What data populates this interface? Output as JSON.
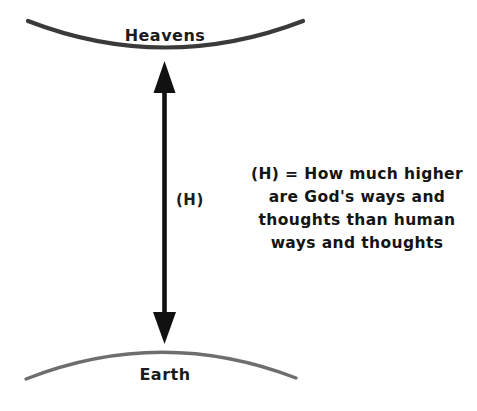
{
  "diagram": {
    "title_alt": "Heavens and Earth comparison diagram",
    "background_color": "#ffffff",
    "heavens": {
      "label": "Heavens",
      "arc_color": "#3a3a3a",
      "arc_thickness": 4
    },
    "earth": {
      "label": "Earth",
      "arc_color": "#6e6e6e",
      "arc_thickness": 3
    },
    "arrow": {
      "label": "(H)",
      "color": "#111111",
      "style": "double-headed-vertical"
    },
    "legend": {
      "lines": [
        "(H) = How much higher",
        "are God's ways and",
        "thoughts than human",
        "ways and thoughts"
      ],
      "color": "#141414"
    }
  }
}
